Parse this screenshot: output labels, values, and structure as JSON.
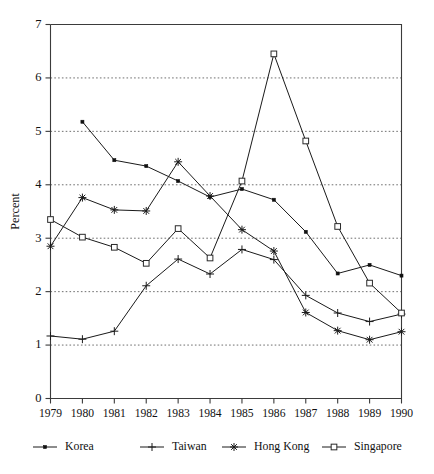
{
  "chart_data": {
    "type": "line",
    "title": "",
    "xlabel": "",
    "ylabel": "Percent",
    "x": [
      1979,
      1980,
      1981,
      1982,
      1983,
      1984,
      1985,
      1986,
      1987,
      1988,
      1989,
      1990
    ],
    "categories": [
      "1979",
      "1980",
      "1981",
      "1982",
      "1983",
      "1984",
      "1985",
      "1986",
      "1987",
      "1988",
      "1989",
      "1990"
    ],
    "xlim": [
      1979,
      1990
    ],
    "ylim": [
      0,
      7
    ],
    "yticks": [
      0,
      1,
      2,
      3,
      4,
      5,
      6,
      7
    ],
    "ytick_labels": [
      "0",
      "1",
      "2",
      "3",
      "4",
      "5",
      "6",
      "7"
    ],
    "grid": "horizontal dotted at 1,2,3,4,5,6",
    "legend_position": "below-axes",
    "series": [
      {
        "name": "Korea",
        "marker": "filled-square",
        "values": [
          null,
          5.18,
          4.46,
          4.35,
          4.07,
          3.77,
          3.92,
          3.72,
          3.12,
          2.34,
          2.5,
          2.3
        ]
      },
      {
        "name": "Taiwan",
        "marker": "plus",
        "values": [
          1.17,
          1.11,
          1.26,
          2.11,
          2.61,
          2.33,
          2.79,
          2.6,
          1.93,
          1.6,
          1.44,
          1.58
        ]
      },
      {
        "name": "Hong Kong",
        "marker": "star",
        "values": [
          2.85,
          3.76,
          3.53,
          3.51,
          4.43,
          3.79,
          3.16,
          2.76,
          1.61,
          1.27,
          1.1,
          1.25
        ]
      },
      {
        "name": "Singapore",
        "marker": "open-square",
        "values": [
          3.35,
          3.02,
          2.83,
          2.53,
          3.18,
          2.63,
          4.07,
          6.45,
          4.82,
          3.22,
          2.16,
          1.6
        ]
      }
    ]
  },
  "legend": {
    "entries": [
      {
        "label": "Korea",
        "marker": "filled-square"
      },
      {
        "label": "Taiwan",
        "marker": "plus"
      },
      {
        "label": "Hong Kong",
        "marker": "star"
      },
      {
        "label": "Singapore",
        "marker": "open-square"
      }
    ]
  },
  "colors": {
    "ink": "#111111",
    "axis": "#3b3b3b",
    "grid": "#555555",
    "background": "#ffffff"
  }
}
